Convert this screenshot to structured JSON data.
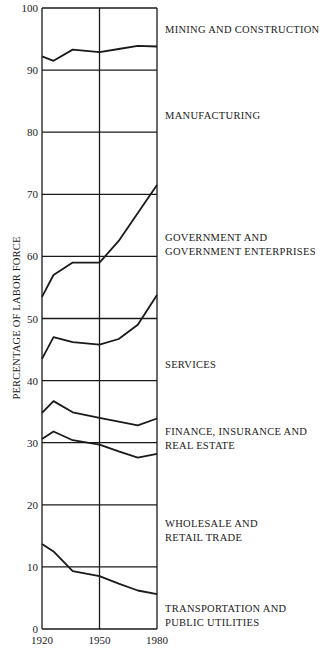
{
  "chart_data": {
    "type": "area",
    "stacked": true,
    "title": "",
    "xlabel": "",
    "ylabel": "PERCENTAGE OF LABOR FORCE",
    "xlim": [
      1920,
      1980
    ],
    "ylim": [
      0,
      100
    ],
    "x_ticks": [
      "1920",
      "1950",
      "1980"
    ],
    "y_ticks": [
      "0",
      "10",
      "20",
      "30",
      "40",
      "50",
      "60",
      "70",
      "80",
      "90",
      "100"
    ],
    "grid": {
      "horizontal": true,
      "vertical_at": [
        1920,
        1950,
        1980
      ]
    },
    "legend_position": "right (inline labels)",
    "boundaries_description": "Cumulative upper boundary of each band (percent of labor force), bottom to top",
    "x": [
      1920,
      1926,
      1936,
      1950,
      1960,
      1970,
      1980
    ],
    "series": [
      {
        "name": "TRANSPORTATION AND PUBLIC UTILITIES",
        "upper_boundary": [
          13.7,
          12.5,
          9.3,
          8.5,
          7.3,
          6.2,
          5.6
        ]
      },
      {
        "name": "WHOLESALE AND RETAIL TRADE",
        "upper_boundary": [
          30.6,
          31.8,
          30.4,
          29.7,
          28.6,
          27.6,
          28.2
        ]
      },
      {
        "name": "FINANCE, INSURANCE AND REAL ESTATE",
        "upper_boundary": [
          34.8,
          36.7,
          34.9,
          34.0,
          33.4,
          32.8,
          33.9
        ]
      },
      {
        "name": "SERVICES",
        "upper_boundary": [
          43.5,
          47.0,
          46.2,
          45.8,
          46.7,
          49.0,
          53.8
        ]
      },
      {
        "name": "GOVERNMENT AND GOVERNMENT ENTERPRISES",
        "upper_boundary": [
          53.5,
          57.0,
          59.0,
          59.0,
          62.5,
          67.0,
          71.5
        ]
      },
      {
        "name": "MANUFACTURING",
        "upper_boundary": [
          92.2,
          91.5,
          93.3,
          92.9,
          93.4,
          93.9,
          93.8
        ]
      },
      {
        "name": "MINING AND CONSTRUCTION",
        "upper_boundary": [
          100,
          100,
          100,
          100,
          100,
          100,
          100
        ]
      }
    ]
  },
  "labels": {
    "ylabel": "PERCENTAGE OF LABOR FORCE",
    "categories": [
      {
        "line1": "MINING AND CONSTRUCTION",
        "line2": ""
      },
      {
        "line1": "MANUFACTURING",
        "line2": ""
      },
      {
        "line1": "GOVERNMENT AND",
        "line2": "GOVERNMENT ENTERPRISES"
      },
      {
        "line1": "SERVICES",
        "line2": ""
      },
      {
        "line1": "FINANCE, INSURANCE AND",
        "line2": "REAL ESTATE"
      },
      {
        "line1": "WHOLESALE AND",
        "line2": "RETAIL TRADE"
      },
      {
        "line1": "TRANSPORTATION AND",
        "line2": "PUBLIC UTILITIES"
      }
    ]
  },
  "colors": {
    "ink": "#1a1a1a",
    "background": "#ffffff"
  }
}
